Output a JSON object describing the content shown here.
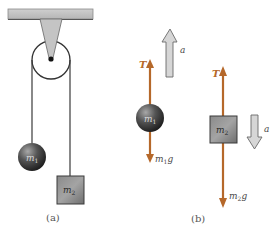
{
  "figure": {
    "panel_a": {
      "caption": "(a)",
      "mass1_label": "m",
      "mass1_sub": "1",
      "mass2_label": "m",
      "mass2_sub": "2"
    },
    "panel_b": {
      "caption": "(b)",
      "mass1": {
        "label": "m",
        "sub": "1",
        "tension_label": "T",
        "weight_label": "m",
        "weight_sub": "1",
        "weight_suffix": "g",
        "accel_label": "a",
        "accel_direction": "up"
      },
      "mass2": {
        "label": "m",
        "sub": "2",
        "tension_label": "T",
        "weight_label": "m",
        "weight_sub": "2",
        "weight_suffix": "g",
        "accel_label": "a",
        "accel_direction": "down"
      }
    },
    "colors": {
      "force_arrow": "#b5682a",
      "accel_arrow_fill": "#d4d4d4",
      "accel_arrow_stroke": "#6a6a6a",
      "ceiling": "#c8c8c8",
      "rope": "#3a3a3a"
    }
  }
}
